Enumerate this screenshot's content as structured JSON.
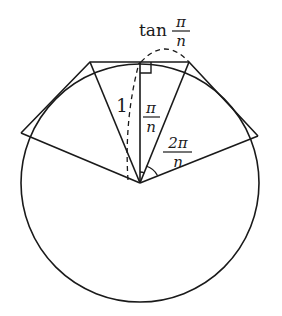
{
  "diagram": {
    "stroke_color": "#1a1a1a",
    "background": "#ffffff",
    "labels": {
      "tan_prefix": "tan",
      "tan_num": "π",
      "tan_den": "n",
      "radius": "1",
      "half_angle_num": "π",
      "half_angle_den": "n",
      "full_angle_num": "2π",
      "full_angle_den": "n"
    },
    "circle": {
      "cx": 140,
      "cy": 183,
      "r": 119
    },
    "polygon_vertices": [
      [
        21,
        133
      ],
      [
        90,
        62
      ],
      [
        189,
        62
      ],
      [
        258,
        136
      ]
    ]
  }
}
